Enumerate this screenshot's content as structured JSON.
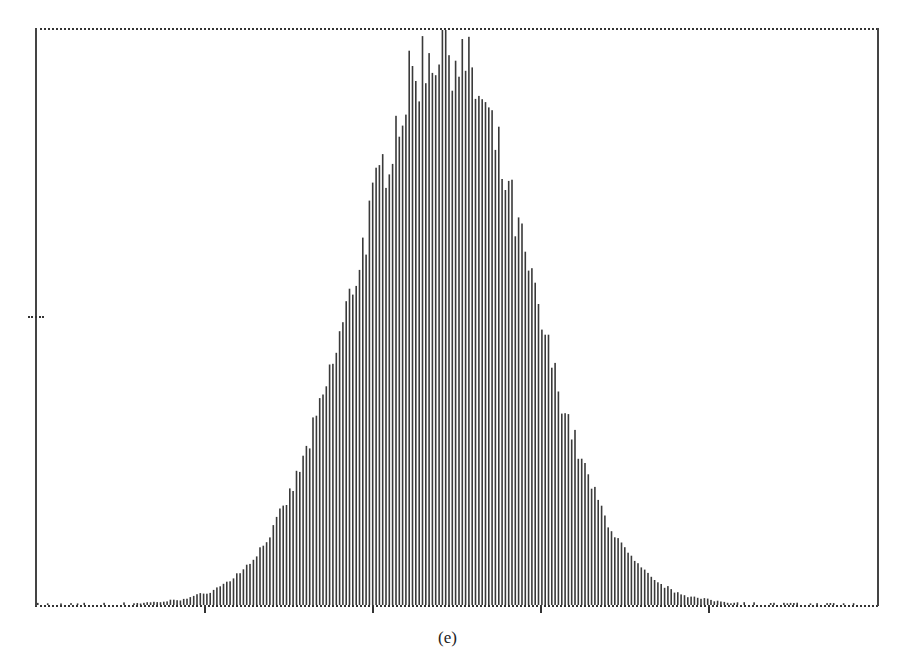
{
  "caption": "(e)",
  "colors": {
    "bars": "#3a3a3a",
    "frame": "#333333",
    "background": "#ffffff"
  },
  "chart_data": {
    "type": "bar",
    "title": "",
    "caption": "(e)",
    "xlabel": "",
    "ylabel": "",
    "x_tick_labels": [
      "",
      "",
      "",
      ""
    ],
    "x_tick_positions_px": [
      205,
      373,
      541,
      709
    ],
    "y_tick_positions_px": [
      317
    ],
    "grid": false,
    "legend": null,
    "bin_count": 253,
    "peak_bin_index": 122,
    "ylim": [
      0,
      1.0
    ],
    "values_normalized": "generated: exp(-0.5*((i-122)/25.5)^2) with noise, peak ~1.0"
  }
}
